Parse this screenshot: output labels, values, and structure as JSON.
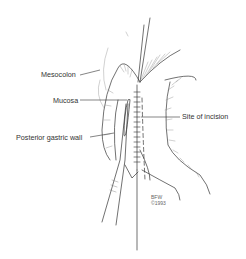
{
  "diagram": {
    "type": "surgical-illustration",
    "labels": [
      {
        "id": "mesocolon",
        "text": "Mesocolon"
      },
      {
        "id": "mucosa",
        "text": "Mucosa"
      },
      {
        "id": "posterior_gastric_wall",
        "text": "Posterior gastric wall"
      },
      {
        "id": "site_of_incision",
        "text": "Site of incision"
      }
    ],
    "signature": {
      "line1": "BFW",
      "line2": "©1993"
    },
    "colors": {
      "ink": "#333333",
      "hatch": "#8a8a8a",
      "background": "#ffffff"
    }
  }
}
